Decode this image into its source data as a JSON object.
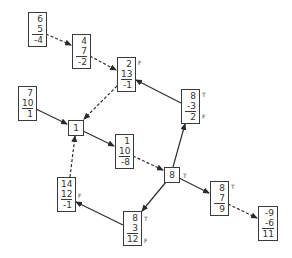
{
  "diagram": {
    "type": "directed-graph",
    "colors": {
      "line": "#3a3a3a",
      "text": "#333333",
      "background": "#ffffff"
    },
    "nodes": [
      {
        "id": "n_6_5_-4",
        "values": [
          "6",
          "5",
          "-4"
        ],
        "tags": []
      },
      {
        "id": "n_4_7_-2",
        "values": [
          "4",
          "7",
          "-2"
        ],
        "tags": []
      },
      {
        "id": "n_2_13_-1",
        "values": [
          "2",
          "13",
          "-1"
        ],
        "tags": [
          "F"
        ]
      },
      {
        "id": "n_7_10_1",
        "values": [
          "7",
          "10",
          "1"
        ],
        "tags": []
      },
      {
        "id": "n_1",
        "values": [
          "1"
        ],
        "tags": []
      },
      {
        "id": "n_8_-3_2",
        "values": [
          "8",
          "-3",
          "2"
        ],
        "tags": [
          "T",
          "F"
        ]
      },
      {
        "id": "n_1_10_-8",
        "values": [
          "1",
          "10",
          "-8"
        ],
        "tags": []
      },
      {
        "id": "n_8",
        "values": [
          "8"
        ],
        "tags": [
          "T"
        ]
      },
      {
        "id": "n_8_7_9",
        "values": [
          "8",
          "7",
          "9"
        ],
        "tags": [
          "T"
        ]
      },
      {
        "id": "n_14_12_-1",
        "values": [
          "14",
          "12",
          "-1"
        ],
        "tags": [
          "F"
        ]
      },
      {
        "id": "n_8_3_12",
        "values": [
          "8",
          "3",
          "12"
        ],
        "tags": [
          "T",
          "F"
        ]
      },
      {
        "id": "n_-9_-6_11",
        "values": [
          "-9",
          "-6",
          "11"
        ],
        "tags": []
      }
    ],
    "edges": [
      {
        "from": "n_6_5_-4",
        "to": "n_4_7_-2",
        "style": "dashed"
      },
      {
        "from": "n_4_7_-2",
        "to": "n_2_13_-1",
        "style": "dashed"
      },
      {
        "from": "n_8_-3_2",
        "to": "n_2_13_-1",
        "style": "solid"
      },
      {
        "from": "n_2_13_-1",
        "to": "n_1",
        "style": "dashed"
      },
      {
        "from": "n_7_10_1",
        "to": "n_1",
        "style": "solid"
      },
      {
        "from": "n_1",
        "to": "n_1_10_-8",
        "style": "solid"
      },
      {
        "from": "n_1_10_-8",
        "to": "n_8",
        "style": "dashed"
      },
      {
        "from": "n_8",
        "to": "n_8_-3_2",
        "style": "solid"
      },
      {
        "from": "n_8",
        "to": "n_8_7_9",
        "style": "solid"
      },
      {
        "from": "n_8",
        "to": "n_8_3_12",
        "style": "solid"
      },
      {
        "from": "n_8_7_9",
        "to": "n_-9_-6_11",
        "style": "dashed"
      },
      {
        "from": "n_8_3_12",
        "to": "n_14_12_-1",
        "style": "solid"
      },
      {
        "from": "n_14_12_-1",
        "to": "n_1",
        "style": "dashed"
      }
    ]
  },
  "labels": {
    "A": {
      "v0": "6",
      "v1": "5",
      "v2": "-4"
    },
    "B": {
      "v0": "4",
      "v1": "7",
      "v2": "-2"
    },
    "C": {
      "v0": "2",
      "v1": "13",
      "v2": "-1",
      "tag0": "F"
    },
    "D": {
      "v0": "7",
      "v1": "10",
      "v2": "1"
    },
    "E": {
      "v0": "1"
    },
    "F": {
      "v0": "8",
      "v1": "-3",
      "v2": "2",
      "tag0": "T",
      "tag1": "F"
    },
    "G": {
      "v0": "1",
      "v1": "10",
      "v2": "-8"
    },
    "H": {
      "v0": "8",
      "tag0": "T"
    },
    "I": {
      "v0": "8",
      "v1": "7",
      "v2": "9",
      "tag0": "T"
    },
    "J": {
      "v0": "14",
      "v1": "12",
      "v2": "-1",
      "tag0": "F"
    },
    "K": {
      "v0": "8",
      "v1": "3",
      "v2": "12",
      "tag0": "T",
      "tag1": "F"
    },
    "L": {
      "v0": "-9",
      "v1": "-6",
      "v2": "11"
    }
  }
}
